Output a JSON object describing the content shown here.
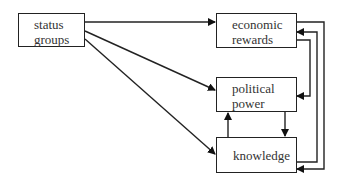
{
  "nodes": {
    "status_groups": {
      "line1": "status",
      "line2": "groups"
    },
    "economic_rewards": {
      "line1": "economic",
      "line2": "rewards"
    },
    "political_power": {
      "line1": "political",
      "line2": "power"
    },
    "knowledge": {
      "line1": "knowledge"
    }
  },
  "edges": [
    {
      "from": "status groups",
      "to": "economic rewards"
    },
    {
      "from": "status groups",
      "to": "political power"
    },
    {
      "from": "status groups",
      "to": "knowledge"
    },
    {
      "from": "knowledge",
      "to": "political power"
    },
    {
      "from": "political power",
      "to": "knowledge"
    },
    {
      "from": "economic rewards",
      "to": "political power"
    },
    {
      "from": "economic rewards",
      "to": "knowledge"
    },
    {
      "from": "knowledge",
      "to": "economic rewards"
    }
  ]
}
